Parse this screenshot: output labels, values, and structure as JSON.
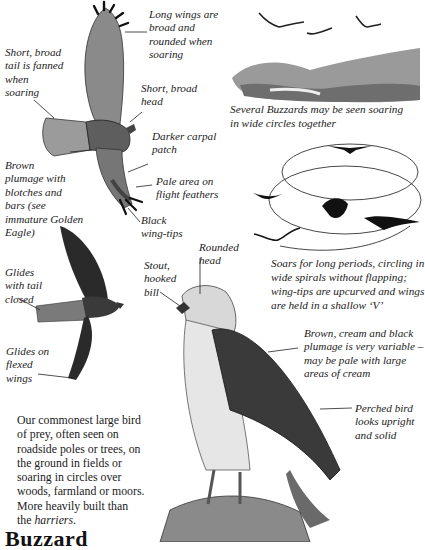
{
  "page": {
    "title": "Buzzard",
    "description_before_em": "Our commonest large bird\nof prey, often seen on\nroadside poles or trees, on\nthe ground in fields or\nsoaring in circles over\nwoods, farmland or moors.\nMore heavily built than\nthe ",
    "description_em": "harriers",
    "description_after_em": "."
  },
  "soaring_bird_labels": {
    "long_wings": "Long wings are\nbroad and\nrounded when\nsoaring",
    "tail": "Short, broad\ntail is fanned\nwhen\nsoaring",
    "head": "Short, broad\nhead",
    "carpal": "Darker carpal\npatch",
    "plumage": "Brown\nplumage with\nblotches and\nbars (see\nimmature Golden\nEagle)",
    "pale_area": "Pale area on\nflight feathers",
    "wing_tips": "Black\nwing-tips"
  },
  "gliding_bird_labels": {
    "tail_closed": "Glides\nwith tail\nclosed",
    "flexed_wings": "Glides on\nflexed\nwings"
  },
  "perched_bird_labels": {
    "head": "Rounded\nhead",
    "bill": "Stout,\nhooked\nbill",
    "plumage": "Brown, cream and black\nplumage is very variable –\nmay be pale with large\nareas of cream",
    "posture": "Perched bird\nlooks upright\nand solid"
  },
  "captions": {
    "landscape": "Several Buzzards may be seen soaring\nin wide circles together",
    "spirals": "Soars for long periods, circling in\nwide spirals without flapping;\nwing-tips are upcurved and wings\nare held in a shallow ‘V’"
  },
  "colors": {
    "ink": "#1d1d1d",
    "paper": "#ffffff",
    "shade": "#6a6a6a"
  }
}
